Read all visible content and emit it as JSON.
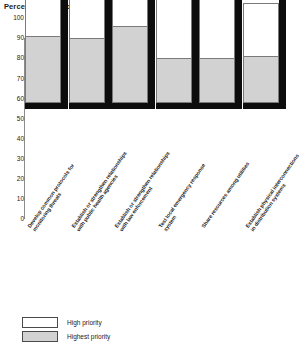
{
  "chart_data": {
    "type": "bar",
    "title": "Percentage of experts",
    "xlabel": "",
    "ylabel": "Percentage of experts",
    "ylim": [
      0,
      100
    ],
    "yticks": [
      100,
      90,
      80,
      70,
      60,
      50,
      40,
      30,
      20,
      10,
      0
    ],
    "grid": false,
    "legend_position": "bottom-left",
    "stacked": true,
    "categories": [
      "Develop common protocols for monitoring threats",
      "Establish or strengthen relationships with public health agencies",
      "Establish or strengthen relationships with law enforcement",
      "Test local emergency response system",
      "Share resources among utilities",
      "Establish physical interconnections in distribution systems"
    ],
    "series": [
      {
        "name": "High priority",
        "values": [
          57,
          53,
          46,
          40,
          33,
          27
        ]
      },
      {
        "name": "Highest priority",
        "values": [
          33,
          32,
          38,
          22,
          22,
          23
        ]
      }
    ],
    "totals": [
      90,
      85,
      84,
      62,
      55,
      50
    ],
    "colors": {
      "high_priority": "#ffffff",
      "highest_priority": "#d2d2d2",
      "bar_outline": "#7a7a7a",
      "bar_shadow": "#0d0d0d",
      "axis": "#8c8c8c",
      "text": "#1a1a1a"
    }
  },
  "legend": {
    "items": [
      {
        "label": "High priority"
      },
      {
        "label": "Highest priority"
      }
    ]
  }
}
